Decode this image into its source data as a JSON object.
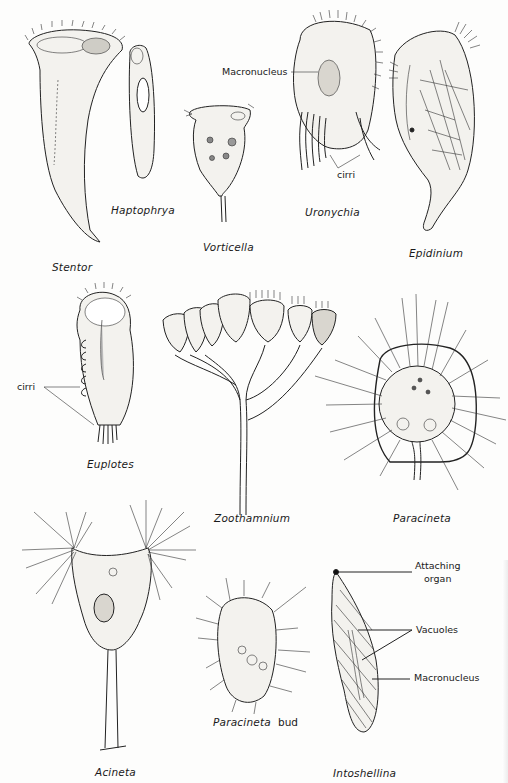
{
  "plate": {
    "background": "#fdfdfc",
    "ink_color": "#1a1a1a",
    "organisms": [
      {
        "name": "Stentor"
      },
      {
        "name": "Haptophrya"
      },
      {
        "name": "Vorticella"
      },
      {
        "name": "Uronychia"
      },
      {
        "name": "Epidinium"
      },
      {
        "name": "Euplotes"
      },
      {
        "name": "Zoothamnium"
      },
      {
        "name": "Paracineta"
      },
      {
        "name": "Acineta"
      },
      {
        "name": "Paracineta",
        "suffix": "bud"
      },
      {
        "name": "Intoshellina"
      }
    ],
    "annotations": {
      "uronychia_macronucleus": "Macronucleus",
      "uronychia_cirri": "cirri",
      "euplotes_cirri": "cirri",
      "intoshellina_attaching_organ_line1": "Attaching",
      "intoshellina_attaching_organ_line2": "organ",
      "intoshellina_vacuoles": "Vacuoles",
      "intoshellina_macronucleus": "Macronucleus"
    }
  }
}
